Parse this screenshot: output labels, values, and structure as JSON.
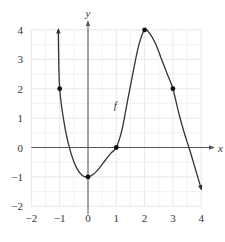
{
  "chart_data": {
    "type": "line",
    "title": "",
    "xlabel": "x",
    "ylabel": "y",
    "xlim": [
      -2,
      4
    ],
    "ylim": [
      -2,
      4
    ],
    "grid": true,
    "minor_grid_step": 0.5,
    "x_ticks": [
      "−2",
      "−1",
      "0",
      "1",
      "2",
      "3",
      "4"
    ],
    "x_tick_values": [
      -2,
      -1,
      0,
      1,
      2,
      3,
      4
    ],
    "y_ticks": [
      "4",
      "3",
      "2",
      "1",
      "0",
      "−1",
      "−2"
    ],
    "y_tick_values": [
      4,
      3,
      2,
      1,
      0,
      -1,
      -2
    ],
    "series": [
      {
        "name": "f",
        "label": "f",
        "label_position": {
          "x": 1.0,
          "y": 1.3
        },
        "arrows": "both",
        "curve": [
          [
            -1.05,
            4.0
          ],
          [
            -1.0,
            2.0
          ],
          [
            -0.8,
            0.6
          ],
          [
            -0.6,
            -0.2
          ],
          [
            -0.4,
            -0.7
          ],
          [
            -0.2,
            -0.95
          ],
          [
            0.0,
            -1.0
          ],
          [
            0.2,
            -0.9
          ],
          [
            0.4,
            -0.7
          ],
          [
            0.6,
            -0.45
          ],
          [
            0.8,
            -0.2
          ],
          [
            1.0,
            0.0
          ],
          [
            1.2,
            0.6
          ],
          [
            1.4,
            1.6
          ],
          [
            1.6,
            2.6
          ],
          [
            1.8,
            3.5
          ],
          [
            2.0,
            4.0
          ],
          [
            2.2,
            3.85
          ],
          [
            2.4,
            3.5
          ],
          [
            2.6,
            3.0
          ],
          [
            2.8,
            2.5
          ],
          [
            3.0,
            2.0
          ],
          [
            3.2,
            1.2
          ],
          [
            3.4,
            0.5
          ],
          [
            3.6,
            -0.1
          ],
          [
            3.8,
            -0.75
          ],
          [
            4.0,
            -1.4
          ]
        ],
        "marked_points": [
          {
            "x": -1,
            "y": 2
          },
          {
            "x": 0,
            "y": -1
          },
          {
            "x": 1,
            "y": 0
          },
          {
            "x": 2,
            "y": 4
          },
          {
            "x": 3,
            "y": 2
          }
        ]
      }
    ]
  }
}
